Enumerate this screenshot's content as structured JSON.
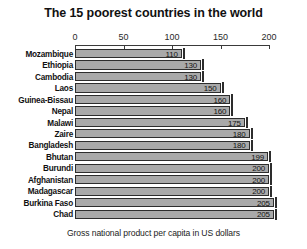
{
  "chart_data": {
    "type": "bar",
    "orientation": "horizontal",
    "title": "The 15 poorest countries in the world",
    "caption": "Gross national product per capita in US dollars",
    "xlabel": "",
    "ylabel": "",
    "xlim": [
      0,
      200
    ],
    "grid": false,
    "legend": null,
    "axis_ticks": [
      0,
      50,
      100,
      150,
      200
    ],
    "axis_tick_labels": [
      "0",
      "50",
      "100",
      "150",
      "200"
    ],
    "categories": [
      "Mozambique",
      "Ethiopia",
      "Cambodia",
      "Laos",
      "Guinea-Bissau",
      "Nepal",
      "Malawi",
      "Zaire",
      "Bangladesh",
      "Bhutan",
      "Burundi",
      "Afghanistan",
      "Madagascar",
      "Burkina Faso",
      "Chad"
    ],
    "values": [
      110,
      130,
      130,
      150,
      160,
      160,
      175,
      180,
      180,
      199,
      200,
      200,
      200,
      205,
      205
    ],
    "value_labels": [
      "110",
      "130",
      "130",
      "150",
      "160",
      "160",
      "175",
      "180",
      "180",
      "199",
      "200",
      "200",
      "200",
      "205",
      "205"
    ],
    "bar_color": "#a9a9a9",
    "bar_border_color": "#2d2d2d",
    "text_color": "#111111"
  }
}
